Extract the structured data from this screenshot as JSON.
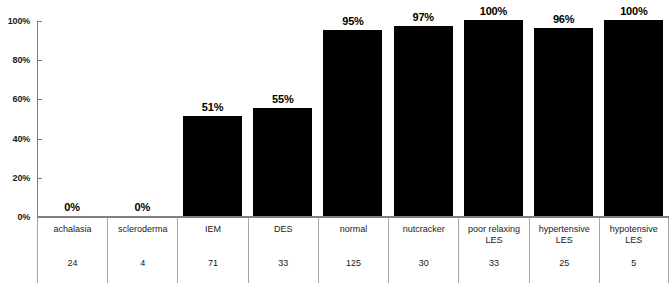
{
  "chart_data": {
    "type": "bar",
    "title": "",
    "subtitle": "",
    "xlabel": "",
    "ylabel": "",
    "ylim": [
      0,
      100
    ],
    "grid": false,
    "legend": false,
    "y_tick_labels": [
      "0%",
      "20%",
      "40%",
      "60%",
      "80%",
      "100%"
    ],
    "y_tick_values": [
      0,
      20,
      40,
      60,
      80,
      100
    ],
    "categories": [
      "achalasia",
      "scleroderma",
      "IEM",
      "DES",
      "normal",
      "nutcracker",
      "poor relaxing LES",
      "hypertensive LES",
      "hypotensive LES"
    ],
    "values": [
      0,
      0,
      51,
      55,
      95,
      97,
      100,
      96,
      100
    ],
    "data_labels": [
      "0%",
      "0%",
      "51%",
      "55%",
      "95%",
      "97%",
      "100%",
      "96%",
      "100%"
    ],
    "counts": [
      24,
      4,
      71,
      33,
      125,
      30,
      33,
      25,
      5
    ],
    "bar_color": "#000000",
    "axis_color": "#808080"
  },
  "axis": {
    "ticks": [
      {
        "label": "100%",
        "value": 100
      },
      {
        "label": "80%",
        "value": 80
      },
      {
        "label": "60%",
        "value": 60
      },
      {
        "label": "40%",
        "value": 40
      },
      {
        "label": "20%",
        "value": 20
      },
      {
        "label": "0%",
        "value": 0
      }
    ]
  },
  "table": {
    "columns": [
      {
        "name_line1": "achalasia",
        "name_line2": "",
        "count": "24"
      },
      {
        "name_line1": "scleroderma",
        "name_line2": "",
        "count": "4"
      },
      {
        "name_line1": "IEM",
        "name_line2": "",
        "count": "71"
      },
      {
        "name_line1": "DES",
        "name_line2": "",
        "count": "33"
      },
      {
        "name_line1": "normal",
        "name_line2": "",
        "count": "125"
      },
      {
        "name_line1": "nutcracker",
        "name_line2": "",
        "count": "30"
      },
      {
        "name_line1": "poor relaxing",
        "name_line2": "LES",
        "count": "33"
      },
      {
        "name_line1": "hypertensive",
        "name_line2": "LES",
        "count": "25"
      },
      {
        "name_line1": "hypotensive",
        "name_line2": "LES",
        "count": "5"
      }
    ]
  }
}
